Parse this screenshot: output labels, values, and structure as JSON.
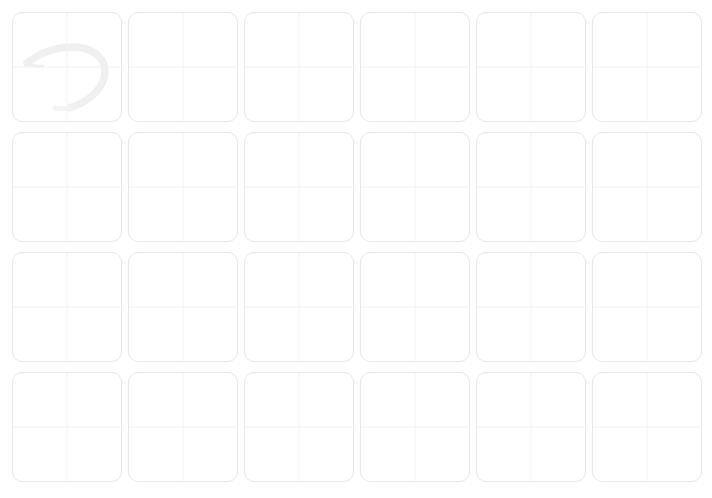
{
  "app": {
    "title": "Handwriting Practice Grid",
    "background_color": "#ffffff"
  },
  "grid": {
    "columns": 6,
    "rows": 4,
    "total_cells": 24,
    "cell_width": 110,
    "cell_height": 110,
    "column_gap": 6,
    "row_gap": 10,
    "origin_x": 12,
    "origin_y": 12,
    "cell_background": "#ffffff",
    "cell_border_color": "#e9e9eb",
    "cell_border_radius": 10,
    "guideline_color": "#f4f4f6",
    "guideline_style": "center-crosshair",
    "bottom_row_clipped": true
  },
  "ink": {
    "stroke_color": "#f0f0f2",
    "stroke_opacity_note": "very faint",
    "filled_cell_indexes": [
      0
    ],
    "empty_cell_count": 23,
    "strokes": [
      {
        "cell_index": 0,
        "shape_name": "backwards-d-hook",
        "path_main": "M 14 50 C 26 40, 44 34, 60 34 C 78 34, 92 44, 92 58 C 92 76, 74 90, 56 95",
        "path_tail": "M 14 50 C 18 52, 24 54, 30 53",
        "path_fade": "M 56 95 C 50 96, 46 96, 42 95"
      }
    ]
  },
  "cells": [
    {
      "index": 0,
      "row": 1,
      "col": 1,
      "has_ink": true
    },
    {
      "index": 1,
      "row": 1,
      "col": 2,
      "has_ink": false
    },
    {
      "index": 2,
      "row": 1,
      "col": 3,
      "has_ink": false
    },
    {
      "index": 3,
      "row": 1,
      "col": 4,
      "has_ink": false
    },
    {
      "index": 4,
      "row": 1,
      "col": 5,
      "has_ink": false
    },
    {
      "index": 5,
      "row": 1,
      "col": 6,
      "has_ink": false
    },
    {
      "index": 6,
      "row": 2,
      "col": 1,
      "has_ink": false
    },
    {
      "index": 7,
      "row": 2,
      "col": 2,
      "has_ink": false
    },
    {
      "index": 8,
      "row": 2,
      "col": 3,
      "has_ink": false
    },
    {
      "index": 9,
      "row": 2,
      "col": 4,
      "has_ink": false
    },
    {
      "index": 10,
      "row": 2,
      "col": 5,
      "has_ink": false
    },
    {
      "index": 11,
      "row": 2,
      "col": 6,
      "has_ink": false
    },
    {
      "index": 12,
      "row": 3,
      "col": 1,
      "has_ink": false
    },
    {
      "index": 13,
      "row": 3,
      "col": 2,
      "has_ink": false
    },
    {
      "index": 14,
      "row": 3,
      "col": 3,
      "has_ink": false
    },
    {
      "index": 15,
      "row": 3,
      "col": 4,
      "has_ink": false
    },
    {
      "index": 16,
      "row": 3,
      "col": 5,
      "has_ink": false
    },
    {
      "index": 17,
      "row": 3,
      "col": 6,
      "has_ink": false
    },
    {
      "index": 18,
      "row": 4,
      "col": 1,
      "has_ink": false
    },
    {
      "index": 19,
      "row": 4,
      "col": 2,
      "has_ink": false
    },
    {
      "index": 20,
      "row": 4,
      "col": 3,
      "has_ink": false
    },
    {
      "index": 21,
      "row": 4,
      "col": 4,
      "has_ink": false
    },
    {
      "index": 22,
      "row": 4,
      "col": 5,
      "has_ink": false
    },
    {
      "index": 23,
      "row": 4,
      "col": 6,
      "has_ink": false
    }
  ]
}
